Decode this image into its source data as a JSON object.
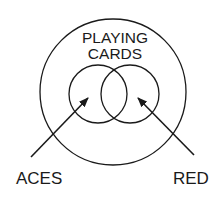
{
  "diagram": {
    "type": "venn",
    "stroke_color": "#1a1a1a",
    "background": "#ffffff",
    "universe": {
      "label_line1": "PLAYING",
      "label_line2": "CARDS",
      "circle": {
        "cx": 113,
        "cy": 92,
        "r": 73
      }
    },
    "sets": [
      {
        "label": "ACES",
        "circle": {
          "cx": 98,
          "cy": 94,
          "r": 29
        },
        "arrow": {
          "x1": 31,
          "y1": 157,
          "x2": 88,
          "y2": 98
        }
      },
      {
        "label": "RED",
        "circle": {
          "cx": 130,
          "cy": 94,
          "r": 29
        },
        "arrow": {
          "x1": 194,
          "y1": 155,
          "x2": 138,
          "y2": 98
        }
      }
    ]
  }
}
